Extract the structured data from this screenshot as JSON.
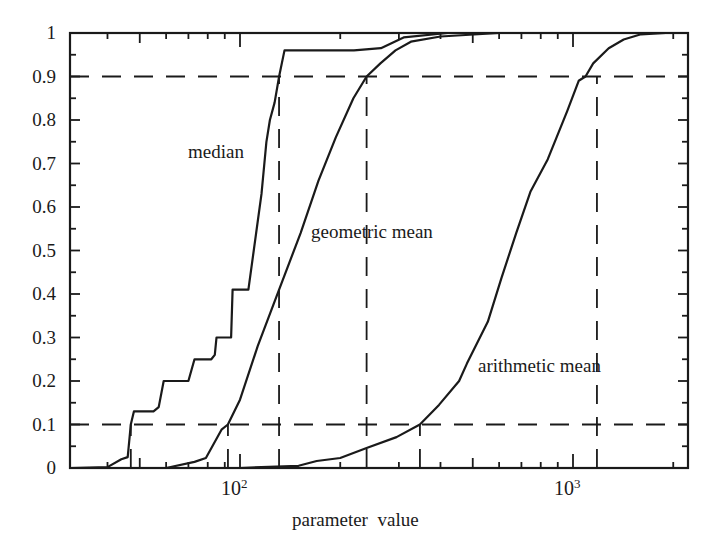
{
  "chart_data": {
    "type": "line",
    "title": "",
    "xlabel": "parameter  value",
    "ylabel": "",
    "xscale": "log",
    "xlim": [
      31,
      2200
    ],
    "ylim": [
      0,
      1
    ],
    "grid": false,
    "legend": "inline labels",
    "y_ticks": [
      "0",
      "0.1",
      "0.2",
      "0.3",
      "0.4",
      "0.5",
      "0.6",
      "0.7",
      "0.8",
      "0.9",
      "1"
    ],
    "x_ticks": [
      {
        "base": "10",
        "exp": "2",
        "value": 100
      },
      {
        "base": "10",
        "exp": "3",
        "value": 1000
      }
    ],
    "series": [
      {
        "name": "median",
        "style": "solid-step",
        "points": [
          [
            31,
            0
          ],
          [
            40,
            0.002
          ],
          [
            44,
            0.02
          ],
          [
            46,
            0.025
          ],
          [
            47,
            0.1
          ],
          [
            48,
            0.13
          ],
          [
            55,
            0.13
          ],
          [
            57,
            0.14
          ],
          [
            59,
            0.2
          ],
          [
            70,
            0.2
          ],
          [
            73,
            0.25
          ],
          [
            82,
            0.25
          ],
          [
            84,
            0.26
          ],
          [
            85,
            0.3
          ],
          [
            94,
            0.3
          ],
          [
            95,
            0.41
          ],
          [
            106,
            0.41
          ],
          [
            116,
            0.63
          ],
          [
            120,
            0.75
          ],
          [
            123,
            0.8
          ],
          [
            127,
            0.84
          ],
          [
            131,
            0.9
          ],
          [
            136,
            0.96
          ],
          [
            220,
            0.96
          ],
          [
            265,
            0.965
          ],
          [
            310,
            0.99
          ],
          [
            420,
            1.0
          ]
        ]
      },
      {
        "name": "geometric mean",
        "style": "solid",
        "points": [
          [
            60,
            0
          ],
          [
            73,
            0.014
          ],
          [
            79,
            0.023
          ],
          [
            88,
            0.088
          ],
          [
            92,
            0.1
          ],
          [
            100,
            0.157
          ],
          [
            113,
            0.28
          ],
          [
            131,
            0.41
          ],
          [
            152,
            0.54
          ],
          [
            172,
            0.66
          ],
          [
            194,
            0.76
          ],
          [
            219,
            0.85
          ],
          [
            240,
            0.9
          ],
          [
            264,
            0.93
          ],
          [
            293,
            0.96
          ],
          [
            326,
            0.98
          ],
          [
            400,
            0.992
          ],
          [
            600,
            1.0
          ]
        ]
      },
      {
        "name": "arithmetic mean",
        "style": "solid",
        "points": [
          [
            100,
            0
          ],
          [
            150,
            0.005
          ],
          [
            170,
            0.016
          ],
          [
            200,
            0.023
          ],
          [
            240,
            0.046
          ],
          [
            295,
            0.071
          ],
          [
            347,
            0.1
          ],
          [
            396,
            0.145
          ],
          [
            455,
            0.2
          ],
          [
            480,
            0.24
          ],
          [
            555,
            0.336
          ],
          [
            610,
            0.437
          ],
          [
            675,
            0.54
          ],
          [
            745,
            0.635
          ],
          [
            840,
            0.71
          ],
          [
            960,
            0.82
          ],
          [
            1040,
            0.89
          ],
          [
            1090,
            0.9
          ],
          [
            1150,
            0.93
          ],
          [
            1280,
            0.965
          ],
          [
            1420,
            0.985
          ],
          [
            1600,
            0.997
          ],
          [
            1900,
            1.0
          ]
        ]
      }
    ],
    "reference_lines": {
      "horizontal": [
        {
          "y": 0.1,
          "style": "dashed"
        },
        {
          "y": 0.9,
          "style": "dashed"
        }
      ],
      "vertical": [
        {
          "x": 47,
          "y_range": [
            0,
            0.1
          ],
          "label": "median 10%"
        },
        {
          "x": 92,
          "y_range": [
            0,
            0.1
          ],
          "label": "geometric mean 10%"
        },
        {
          "x": 347,
          "y_range": [
            0,
            0.1
          ],
          "label": "arithmetic mean 10%"
        },
        {
          "x": 131,
          "y_range": [
            0,
            0.9
          ],
          "label": "median 90%"
        },
        {
          "x": 240,
          "y_range": [
            0,
            0.9
          ],
          "label": "geometric mean 90%"
        },
        {
          "x": 1180,
          "y_range": [
            0,
            0.9
          ],
          "label": "arithmetic mean 90%"
        }
      ]
    },
    "annotations": [
      {
        "text": "median",
        "at": [
          80,
          0.72
        ]
      },
      {
        "text": "geometric mean",
        "at": [
          170,
          0.55
        ]
      },
      {
        "text": "arithmetic mean",
        "at": [
          520,
          0.23
        ]
      }
    ]
  },
  "labels": {
    "xlabel": "parameter  value",
    "x10_2_base": "10",
    "x10_2_exp": "2",
    "x10_3_base": "10",
    "x10_3_exp": "3",
    "median": "median",
    "geometric_mean": "geometric mean",
    "arithmetic_mean": "arithmetic mean"
  },
  "colors": {
    "ink": "#1a1a1a",
    "background": "#ffffff"
  }
}
